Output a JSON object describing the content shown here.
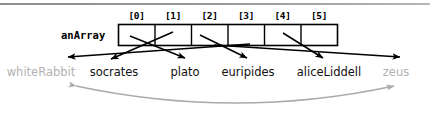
{
  "diagram": {
    "variable_label": "anArray",
    "indices": [
      "[0]",
      "[1]",
      "[2]",
      "[3]",
      "[4]",
      "[5]"
    ],
    "objects": [
      {
        "name": "whiteRabbit",
        "referenced": false,
        "color": "#b2b2b2"
      },
      {
        "name": "socrates",
        "referenced": true,
        "color": "#111111"
      },
      {
        "name": "plato",
        "referenced": true,
        "color": "#111111"
      },
      {
        "name": "euripides",
        "referenced": true,
        "color": "#111111"
      },
      {
        "name": "aliceLiddell",
        "referenced": true,
        "color": "#111111"
      },
      {
        "name": "zeus",
        "referenced": false,
        "color": "#b2b2b2"
      }
    ],
    "colors": {
      "box_stroke": "#000000",
      "box_fill": "#ffffff",
      "arrow": "#000000",
      "muted_arrow": "#aaaaaa",
      "rule": "#8e8e8e"
    },
    "array_cells": 6,
    "notes": {
      "scope_arc": "double-headed gray arc spanning whiteRabbit to zeus"
    }
  }
}
